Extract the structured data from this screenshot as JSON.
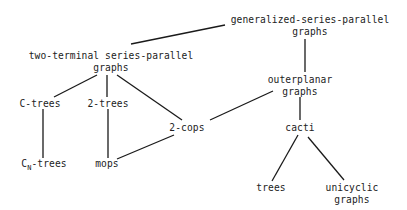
{
  "diagram": {
    "type": "hierarchy",
    "nodes": {
      "gsp": {
        "line1": "generalized-series-parallel",
        "line2": "graphs"
      },
      "ttsp": {
        "line1": "two-terminal series-parallel",
        "line2": "graphs"
      },
      "outerplanar": {
        "line1": "outerplanar",
        "line2": "graphs"
      },
      "ctrees": {
        "label": "C-trees"
      },
      "twotrees": {
        "label": "2-trees"
      },
      "twocops": {
        "label": "2-cops"
      },
      "cacti": {
        "label": "cacti"
      },
      "cntrees": {
        "prefix": "C",
        "subscript": "N",
        "suffix": "-trees"
      },
      "mops": {
        "label": "mops"
      },
      "trees": {
        "label": "trees"
      },
      "unicyclic": {
        "line1": "unicyclic",
        "line2": "graphs"
      }
    },
    "edges": [
      [
        "generalized-series-parallel graphs",
        "two-terminal series-parallel graphs"
      ],
      [
        "generalized-series-parallel graphs",
        "outerplanar graphs"
      ],
      [
        "two-terminal series-parallel graphs",
        "C-trees"
      ],
      [
        "two-terminal series-parallel graphs",
        "2-trees"
      ],
      [
        "two-terminal series-parallel graphs",
        "2-cops"
      ],
      [
        "outerplanar graphs",
        "2-cops"
      ],
      [
        "outerplanar graphs",
        "cacti"
      ],
      [
        "C-trees",
        "CN-trees"
      ],
      [
        "2-trees",
        "mops"
      ],
      [
        "2-cops",
        "mops"
      ],
      [
        "cacti",
        "trees"
      ],
      [
        "cacti",
        "unicyclic graphs"
      ]
    ]
  }
}
